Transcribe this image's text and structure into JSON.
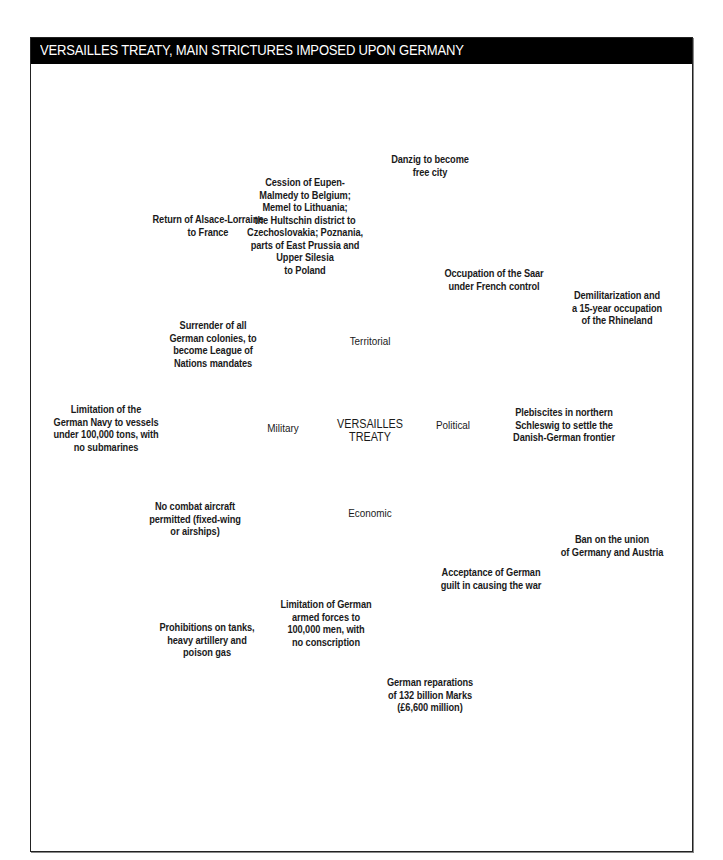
{
  "header": {
    "title": "VERSAILLES TREATY, MAIN STRICTURES IMPOSED UPON GERMANY"
  },
  "colors": {
    "header_bg": "#000000",
    "header_text": "#ffffff",
    "bubble_fill_light": "#d4d4d4",
    "bubble_fill_dark": "#a9a9a9",
    "stroke": "#6e6e6e",
    "hub_fill": "#ffffff"
  },
  "center": {
    "label_line1": "VERSAILLES",
    "label_line2": "TREATY"
  },
  "hubs": {
    "territorial": {
      "label": "Territorial"
    },
    "political": {
      "label": "Political"
    },
    "military": {
      "label": "Military"
    },
    "economic": {
      "label": "Economic"
    }
  },
  "bubbles": {
    "territorial": [
      {
        "lines": [
          "Return of Alsace-Lorraine",
          "to France"
        ]
      },
      {
        "lines": [
          "Cession of Eupen-",
          "Malmedy to Belgium;",
          "Memel to Lithuania;",
          "the Hultschin district to",
          "Czechoslovakia; Poznania,",
          "parts of East Prussia and",
          "Upper Silesia",
          "to Poland"
        ]
      },
      {
        "lines": [
          "Danzig to become",
          "free city"
        ]
      },
      {
        "lines": [
          "Occupation of the Saar",
          "under French control"
        ]
      },
      {
        "lines": [
          "Demilitarization and",
          "a 15-year occupation",
          "of the Rhineland"
        ]
      },
      {
        "lines": [
          "Surrender of all",
          "German colonies, to",
          "become League of",
          "Nations mandates"
        ]
      }
    ],
    "military": [
      {
        "lines": [
          "Limitation of the",
          "German Navy to vessels",
          "under 100,000 tons, with",
          "no submarines"
        ]
      },
      {
        "lines": [
          "No combat aircraft",
          "permitted (fixed-wing",
          "or airships)"
        ]
      },
      {
        "lines": [
          "Prohibitions on tanks,",
          "heavy artillery and",
          "poison gas"
        ]
      },
      {
        "lines": [
          "Limitation of German",
          "armed forces to",
          "100,000 men, with",
          "no conscription"
        ]
      }
    ],
    "economic": [
      {
        "lines": [
          "German reparations",
          "of 132 billion Marks",
          "(£6,600 million)"
        ]
      }
    ],
    "political": [
      {
        "lines": [
          "Plebiscites in northern",
          "Schleswig to settle the",
          "Danish-German frontier"
        ]
      },
      {
        "lines": [
          "Acceptance of German",
          "guilt in causing the war"
        ]
      },
      {
        "lines": [
          "Ban on the union",
          "of Germany and Austria"
        ]
      }
    ]
  }
}
